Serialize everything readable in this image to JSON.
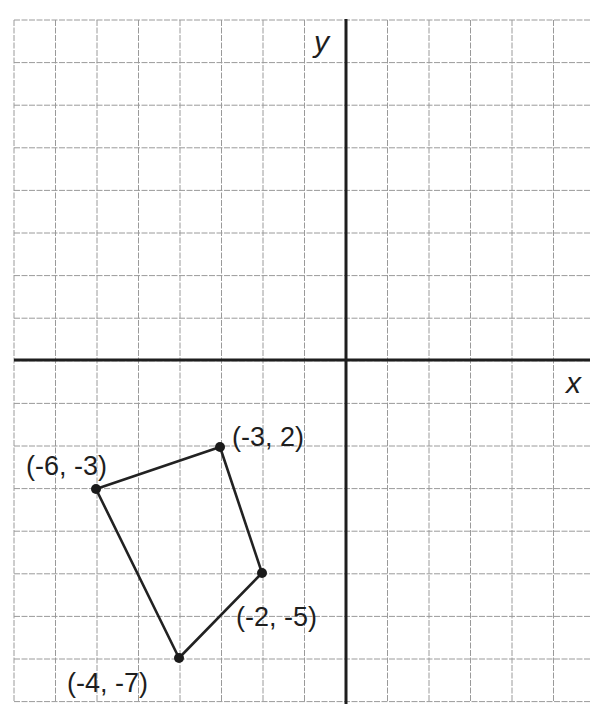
{
  "figure": {
    "type": "coordinate-plane",
    "axes": {
      "x_label": "x",
      "y_label": "y",
      "x_range": [
        -8,
        6
      ],
      "y_range": [
        -8,
        8
      ],
      "grid": true,
      "grid_step": 1
    },
    "polygon": {
      "shape": "quadrilateral",
      "vertices": [
        {
          "label": "(-3, 2)",
          "x": -3,
          "y": 2,
          "plotted_x": -3,
          "plotted_y": -2
        },
        {
          "label": "(-2, -5)",
          "x": -2,
          "y": -5,
          "plotted_x": -2,
          "plotted_y": -5
        },
        {
          "label": "(-4, -7)",
          "x": -4,
          "y": -7,
          "plotted_x": -4,
          "plotted_y": -7
        },
        {
          "label": "(-6, -3)",
          "x": -6,
          "y": -3,
          "plotted_x": -6,
          "plotted_y": -3
        }
      ]
    },
    "colors": {
      "grid": "#9a9a9a",
      "axis": "#1e1e1e",
      "shape": "#222222",
      "background": "#ffffff"
    }
  }
}
